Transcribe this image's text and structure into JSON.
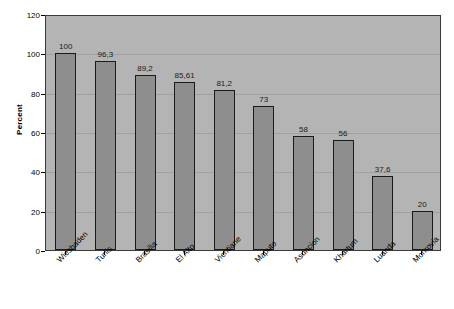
{
  "chart_data": {
    "type": "bar",
    "title": "",
    "subtitle": "",
    "xlabel": "",
    "ylabel": "Percent",
    "ylim": [
      0,
      120
    ],
    "ytick_step": 20,
    "yticks": [
      "0",
      "20",
      "40",
      "60",
      "80",
      "100",
      "120"
    ],
    "grid": true,
    "legend": false,
    "legend_position": "none",
    "decimal_separator": ",",
    "categories": [
      "Wiesbaden",
      "Tunis",
      "Brasilia",
      "El Alto",
      "Vientiane",
      "Maputo",
      "Asuncion",
      "Khartum",
      "Luanda",
      "Monrovia"
    ],
    "values": [
      100,
      96.3,
      89.2,
      85.61,
      81.2,
      73,
      58,
      56,
      37.6,
      20
    ],
    "value_labels": [
      "100",
      "96,3",
      "89,2",
      "85,61",
      "81,2",
      "73",
      "58",
      "56",
      "37,6",
      "20"
    ],
    "colors": {
      "plot_background": "#b4b4b4",
      "bar_fill": "#8e8e8e",
      "bar_border": "#1a1a1a",
      "gridline": "#a0a0a0",
      "axis": "#3a3a3a",
      "text": "#000000",
      "page_background": "#ffffff"
    }
  }
}
